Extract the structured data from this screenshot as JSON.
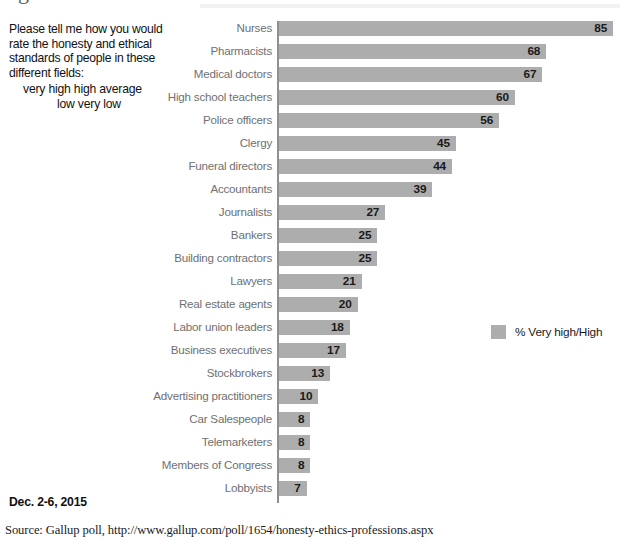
{
  "question": {
    "text": "Please tell me how you would\nrate the honesty and ethical\nstandards of people in these\ndifferent fields:",
    "scale_line1": "very high     high     average",
    "scale_line2": "low     very low"
  },
  "legend": {
    "label": "% Very high/High",
    "swatch_color": "#adadad"
  },
  "footer": {
    "date": "Dec. 2-6, 2015",
    "source": "Source: Gallup poll, http://www.gallup.com/poll/1654/honesty-ethics-professions.aspx"
  },
  "title_descender_glyph": "g",
  "chart_data": {
    "type": "bar",
    "orientation": "horizontal",
    "title": "",
    "xlabel": "",
    "ylabel": "",
    "xlim": [
      0,
      85
    ],
    "grid": false,
    "legend_position": "right-middle",
    "bar_color": "#adadad",
    "value_label_position": "inside-right",
    "categories": [
      "Nurses",
      "Pharmacists",
      "Medical doctors",
      "High school teachers",
      "Police officers",
      "Clergy",
      "Funeral directors",
      "Accountants",
      "Journalists",
      "Bankers",
      "Building contractors",
      "Lawyers",
      "Real estate agents",
      "Labor union leaders",
      "Business executives",
      "Stockbrokers",
      "Advertising practitioners",
      "Car Salespeople",
      "Telemarketers",
      "Members of Congress",
      "Lobbyists"
    ],
    "values": [
      85,
      68,
      67,
      60,
      56,
      45,
      44,
      39,
      27,
      25,
      25,
      21,
      20,
      18,
      17,
      13,
      10,
      8,
      8,
      8,
      7
    ],
    "series": [
      {
        "name": "% Very high/High",
        "values": [
          85,
          68,
          67,
          60,
          56,
          45,
          44,
          39,
          27,
          25,
          25,
          21,
          20,
          18,
          17,
          13,
          10,
          8,
          8,
          8,
          7
        ]
      }
    ]
  }
}
